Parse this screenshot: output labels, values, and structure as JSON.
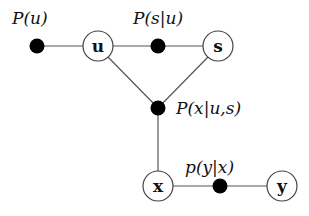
{
  "diagram": {
    "type": "factor-graph",
    "variable_nodes": [
      {
        "id": "u",
        "label": "u",
        "x": 98,
        "y": 46
      },
      {
        "id": "s",
        "label": "s",
        "x": 218,
        "y": 46
      },
      {
        "id": "x",
        "label": "x",
        "x": 158,
        "y": 186
      },
      {
        "id": "y",
        "label": "y",
        "x": 282,
        "y": 186
      }
    ],
    "factor_nodes": [
      {
        "id": "f_u",
        "label": "P(u)",
        "x": 37,
        "y": 46
      },
      {
        "id": "f_su",
        "label": "P(s|u)",
        "x": 158,
        "y": 46
      },
      {
        "id": "f_xus",
        "label": "P(x|u,s)",
        "x": 158,
        "y": 108
      },
      {
        "id": "f_yx",
        "label": "p(y|x)",
        "x": 220,
        "y": 186
      }
    ],
    "edges": [
      [
        "f_u",
        "u"
      ],
      [
        "u",
        "f_su"
      ],
      [
        "f_su",
        "s"
      ],
      [
        "u",
        "f_xus"
      ],
      [
        "s",
        "f_xus"
      ],
      [
        "f_xus",
        "x"
      ],
      [
        "x",
        "f_yx"
      ],
      [
        "f_yx",
        "y"
      ]
    ]
  },
  "labels": {
    "f_u": "P(u)",
    "f_su": "P(s|u)",
    "f_xus": "P(x|u,s)",
    "f_yx": "p(y|x)",
    "u": "u",
    "s": "s",
    "x": "x",
    "y": "y"
  }
}
